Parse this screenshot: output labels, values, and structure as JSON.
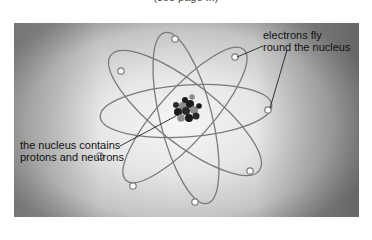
{
  "header": {
    "caption_partial": "(see page ...)"
  },
  "diagram": {
    "labels": {
      "electrons_line1": "electrons fly",
      "electrons_line2": "round the nucleus",
      "nucleus_line1": "the nucleus contains",
      "nucleus_line2": "protons and neutrons"
    },
    "nucleus": {
      "cx": 185,
      "cy": 111,
      "particle_colors": [
        "#1a1a1a",
        "#8c8c8c"
      ]
    },
    "orbit_color": "#7a7a7a",
    "electron_fill": "#ffffff",
    "electron_stroke": "#7a7a7a"
  }
}
